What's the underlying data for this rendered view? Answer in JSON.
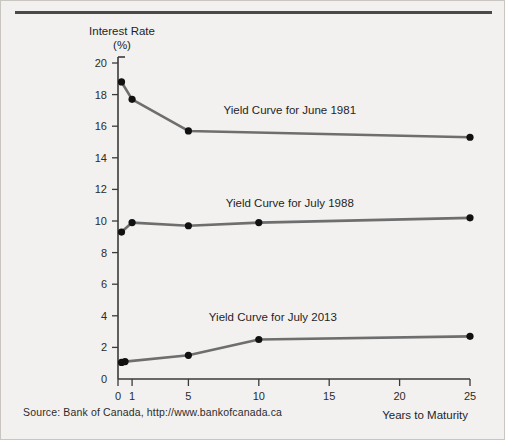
{
  "figure": {
    "source_note": "Source: Bank of Canada, http://www.bankofcanada.ca"
  },
  "chart_data": {
    "type": "line",
    "title": "",
    "xlabel": "Years to Maturity",
    "ylabel": "Interest Rate",
    "ylabel_unit": "(%)",
    "xlim": [
      0,
      25
    ],
    "ylim": [
      0,
      20
    ],
    "grid": false,
    "legend_position": "inline-annotations",
    "xticks": [
      0,
      1,
      5,
      10,
      15,
      20,
      25
    ],
    "xticklabels": [
      "0",
      "1",
      "5",
      "10",
      "15",
      "20",
      "25"
    ],
    "yticks": [
      0,
      2,
      4,
      6,
      8,
      10,
      12,
      14,
      16,
      18,
      20
    ],
    "yticklabels": [
      "0",
      "2",
      "4",
      "6",
      "8",
      "10",
      "12",
      "14",
      "16",
      "18",
      "20"
    ],
    "line_color": "#6e6e6e",
    "marker_color": "#111111",
    "series": [
      {
        "name": "Yield Curve for June 1981",
        "label": "Yield Curve for June 1981",
        "x": [
          0.25,
          1,
          5,
          25
        ],
        "values": [
          18.8,
          17.7,
          15.7,
          15.3
        ],
        "label_x": 12.2,
        "label_y": 16.8
      },
      {
        "name": "Yield Curve for July 1988",
        "label": "Yield Curve for July 1988",
        "x": [
          0.25,
          1,
          5,
          10,
          25
        ],
        "values": [
          9.3,
          9.9,
          9.7,
          9.9,
          10.2
        ],
        "label_x": 12.2,
        "label_y": 10.9
      },
      {
        "name": "Yield Curve for July 2013",
        "label": "Yield Curve for July 2013",
        "x": [
          0.25,
          0.5,
          5,
          10,
          25
        ],
        "values": [
          1.05,
          1.1,
          1.5,
          2.5,
          2.7
        ],
        "label_x": 11.0,
        "label_y": 3.7
      }
    ]
  }
}
